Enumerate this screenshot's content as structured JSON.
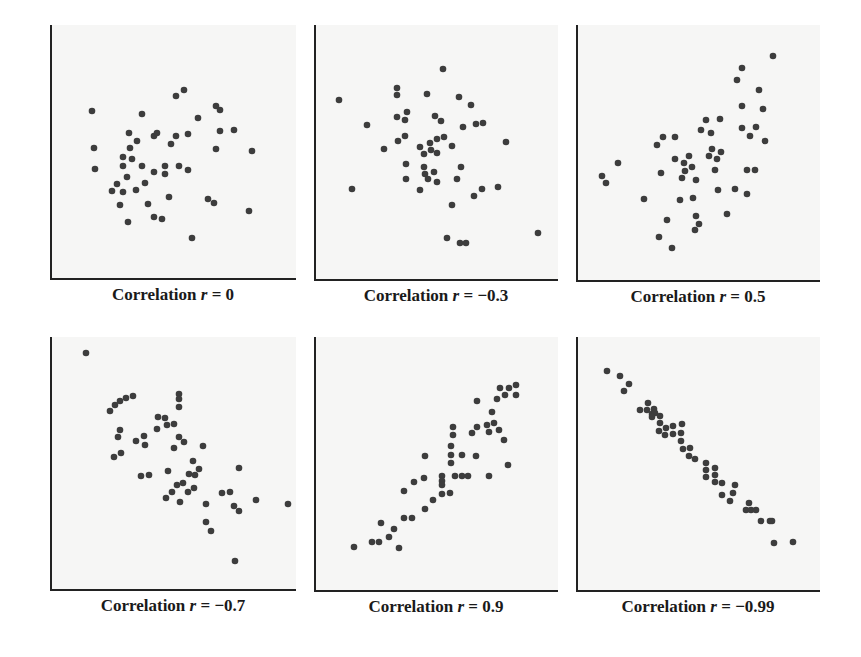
{
  "style": {
    "dot_color": "#3d3d3d",
    "axis_color": "#222222",
    "plot_bg": "#f6f6f5",
    "dot_radius": 3.3
  },
  "chart_data": [
    {
      "type": "scatter",
      "title": "Correlation r = 0",
      "r": "0",
      "caption": {
        "prefix": "Correlation ",
        "var": "r",
        "suffix": " = 0"
      },
      "box": {
        "x": 50,
        "y": 25,
        "w": 246,
        "h": 254
      },
      "points": [
        [
          42,
          86
        ],
        [
          44,
          123
        ],
        [
          45,
          144
        ],
        [
          92,
          89
        ],
        [
          126,
          71
        ],
        [
          134,
          65
        ],
        [
          166,
          81
        ],
        [
          170,
          85
        ],
        [
          148,
          93
        ],
        [
          79,
          108
        ],
        [
          87,
          116
        ],
        [
          104,
          111
        ],
        [
          107,
          108
        ],
        [
          126,
          111
        ],
        [
          138,
          109
        ],
        [
          170,
          106
        ],
        [
          184,
          105
        ],
        [
          80,
          123
        ],
        [
          121,
          119
        ],
        [
          166,
          124
        ],
        [
          202,
          126
        ],
        [
          73,
          132
        ],
        [
          82,
          134
        ],
        [
          73,
          141
        ],
        [
          92,
          141
        ],
        [
          115,
          141
        ],
        [
          129,
          141
        ],
        [
          138,
          145
        ],
        [
          104,
          147
        ],
        [
          115,
          149
        ],
        [
          77,
          152
        ],
        [
          67,
          159
        ],
        [
          95,
          158
        ],
        [
          62,
          166
        ],
        [
          73,
          167
        ],
        [
          86,
          165
        ],
        [
          119,
          172
        ],
        [
          158,
          174
        ],
        [
          164,
          178
        ],
        [
          70,
          180
        ],
        [
          98,
          179
        ],
        [
          104,
          192
        ],
        [
          112,
          194
        ],
        [
          78,
          197
        ],
        [
          199,
          186
        ],
        [
          142,
          213
        ]
      ]
    },
    {
      "type": "scatter",
      "title": "Correlation r = −0.3",
      "r": "-0.3",
      "caption": {
        "prefix": "Correlation ",
        "var": "r",
        "suffix": " = −0.3"
      },
      "box": {
        "x": 314,
        "y": 25,
        "w": 244,
        "h": 255
      },
      "points": [
        [
          25,
          75
        ],
        [
          38,
          164
        ],
        [
          53,
          100
        ],
        [
          70,
          124
        ],
        [
          83,
          63
        ],
        [
          83,
          70
        ],
        [
          83,
          92
        ],
        [
          91,
          95
        ],
        [
          93,
          87
        ],
        [
          84,
          116
        ],
        [
          91,
          111
        ],
        [
          92,
          139
        ],
        [
          92,
          154
        ],
        [
          106,
          165
        ],
        [
          113,
          69
        ],
        [
          129,
          44
        ],
        [
          121,
          91
        ],
        [
          127,
          96
        ],
        [
          106,
          122
        ],
        [
          110,
          129
        ],
        [
          116,
          118
        ],
        [
          117,
          125
        ],
        [
          123,
          114
        ],
        [
          130,
          112
        ],
        [
          123,
          128
        ],
        [
          110,
          142
        ],
        [
          111,
          149
        ],
        [
          114,
          154
        ],
        [
          120,
          147
        ],
        [
          123,
          157
        ],
        [
          138,
          121
        ],
        [
          145,
          72
        ],
        [
          149,
          102
        ],
        [
          157,
          80
        ],
        [
          162,
          99
        ],
        [
          169,
          98
        ],
        [
          147,
          142
        ],
        [
          143,
          154
        ],
        [
          138,
          180
        ],
        [
          160,
          171
        ],
        [
          168,
          164
        ],
        [
          184,
          162
        ],
        [
          192,
          117
        ],
        [
          133,
          213
        ],
        [
          146,
          218
        ],
        [
          152,
          218
        ],
        [
          224,
          208
        ]
      ]
    },
    {
      "type": "scatter",
      "title": "Correlation r = 0.5",
      "r": "0.5",
      "caption": {
        "prefix": "Correlation ",
        "var": "r",
        "suffix": " = 0.5"
      },
      "box": {
        "x": 576,
        "y": 25,
        "w": 244,
        "h": 256
      },
      "points": [
        [
          26,
          151
        ],
        [
          30,
          158
        ],
        [
          42,
          138
        ],
        [
          68,
          174
        ],
        [
          81,
          120
        ],
        [
          87,
          112
        ],
        [
          85,
          148
        ],
        [
          91,
          195
        ],
        [
          83,
          212
        ],
        [
          96,
          223
        ],
        [
          99,
          112
        ],
        [
          99,
          134
        ],
        [
          104,
          175
        ],
        [
          106,
          153
        ],
        [
          108,
          138
        ],
        [
          109,
          146
        ],
        [
          113,
          131
        ],
        [
          116,
          142
        ],
        [
          117,
          173
        ],
        [
          120,
          155
        ],
        [
          120,
          191
        ],
        [
          123,
          199
        ],
        [
          119,
          205
        ],
        [
          125,
          105
        ],
        [
          130,
          95
        ],
        [
          135,
          108
        ],
        [
          136,
          124
        ],
        [
          133,
          131
        ],
        [
          141,
          134
        ],
        [
          145,
          127
        ],
        [
          139,
          145
        ],
        [
          142,
          165
        ],
        [
          144,
          94
        ],
        [
          151,
          189
        ],
        [
          159,
          164
        ],
        [
          161,
          55
        ],
        [
          166,
          43
        ],
        [
          166,
          81
        ],
        [
          166,
          103
        ],
        [
          171,
          145
        ],
        [
          171,
          169
        ],
        [
          174,
          111
        ],
        [
          179,
          145
        ],
        [
          180,
          102
        ],
        [
          183,
          65
        ],
        [
          187,
          84
        ],
        [
          189,
          116
        ],
        [
          197,
          31
        ]
      ]
    },
    {
      "type": "scatter",
      "title": "Correlation r = −0.7",
      "r": "-0.7",
      "caption": {
        "prefix": "Correlation ",
        "var": "r",
        "suffix": " = −0.7"
      },
      "box": {
        "x": 50,
        "y": 337,
        "w": 246,
        "h": 253
      },
      "points": [
        [
          36,
          16
        ],
        [
          60,
          74
        ],
        [
          65,
          68
        ],
        [
          70,
          64
        ],
        [
          76,
          61
        ],
        [
          83,
          59
        ],
        [
          70,
          93
        ],
        [
          68,
          100
        ],
        [
          71,
          116
        ],
        [
          64,
          120
        ],
        [
          86,
          104
        ],
        [
          94,
          99
        ],
        [
          95,
          108
        ],
        [
          91,
          139
        ],
        [
          99,
          138
        ],
        [
          108,
          80
        ],
        [
          115,
          81
        ],
        [
          107,
          92
        ],
        [
          117,
          88
        ],
        [
          124,
          87
        ],
        [
          129,
          57
        ],
        [
          129,
          62
        ],
        [
          129,
          70
        ],
        [
          129,
          100
        ],
        [
          134,
          105
        ],
        [
          124,
          111
        ],
        [
          153,
          109
        ],
        [
          118,
          134
        ],
        [
          143,
          124
        ],
        [
          139,
          137
        ],
        [
          145,
          138
        ],
        [
          149,
          132
        ],
        [
          127,
          148
        ],
        [
          133,
          146
        ],
        [
          122,
          155
        ],
        [
          116,
          161
        ],
        [
          130,
          165
        ],
        [
          138,
          155
        ],
        [
          144,
          151
        ],
        [
          156,
          167
        ],
        [
          156,
          185
        ],
        [
          161,
          194
        ],
        [
          172,
          156
        ],
        [
          180,
          155
        ],
        [
          189,
          131
        ],
        [
          184,
          169
        ],
        [
          189,
          174
        ],
        [
          206,
          163
        ],
        [
          238,
          167
        ],
        [
          185,
          224
        ]
      ]
    },
    {
      "type": "scatter",
      "title": "Correlation r = 0.9",
      "r": "0.9",
      "caption": {
        "prefix": "Correlation ",
        "var": "r",
        "suffix": " = 0.9"
      },
      "box": {
        "x": 314,
        "y": 337,
        "w": 244,
        "h": 254
      },
      "points": [
        [
          40,
          210
        ],
        [
          58,
          205
        ],
        [
          65,
          205
        ],
        [
          67,
          186
        ],
        [
          75,
          200
        ],
        [
          80,
          192
        ],
        [
          85,
          211
        ],
        [
          90,
          181
        ],
        [
          98,
          181
        ],
        [
          90,
          154
        ],
        [
          100,
          145
        ],
        [
          110,
          141
        ],
        [
          111,
          119
        ],
        [
          111,
          172
        ],
        [
          119,
          163
        ],
        [
          128,
          157
        ],
        [
          136,
          156
        ],
        [
          128,
          139
        ],
        [
          128,
          144
        ],
        [
          128,
          148
        ],
        [
          141,
          139
        ],
        [
          148,
          139
        ],
        [
          154,
          139
        ],
        [
          137,
          126
        ],
        [
          137,
          118
        ],
        [
          137,
          109
        ],
        [
          139,
          98
        ],
        [
          139,
          90
        ],
        [
          148,
          118
        ],
        [
          162,
          119
        ],
        [
          158,
          96
        ],
        [
          163,
          90
        ],
        [
          163,
          64
        ],
        [
          173,
          88
        ],
        [
          175,
          95
        ],
        [
          180,
          86
        ],
        [
          178,
          75
        ],
        [
          185,
          93
        ],
        [
          190,
          103
        ],
        [
          194,
          128
        ],
        [
          175,
          139
        ],
        [
          183,
          62
        ],
        [
          186,
          51
        ],
        [
          191,
          58
        ],
        [
          195,
          51
        ],
        [
          202,
          48
        ],
        [
          202,
          58
        ]
      ]
    },
    {
      "type": "scatter",
      "title": "Correlation r = −0.99",
      "r": "-0.99",
      "caption": {
        "prefix": "Correlation ",
        "var": "r",
        "suffix": " = −0.99"
      },
      "box": {
        "x": 576,
        "y": 337,
        "w": 244,
        "h": 254
      },
      "points": [
        [
          31,
          34
        ],
        [
          44,
          39
        ],
        [
          53,
          47
        ],
        [
          48,
          54
        ],
        [
          64,
          73
        ],
        [
          72,
          66
        ],
        [
          71,
          73
        ],
        [
          78,
          72
        ],
        [
          76,
          77
        ],
        [
          79,
          76
        ],
        [
          76,
          80
        ],
        [
          84,
          79
        ],
        [
          84,
          86
        ],
        [
          83,
          94
        ],
        [
          90,
          91
        ],
        [
          89,
          98
        ],
        [
          97,
          89
        ],
        [
          97,
          97
        ],
        [
          106,
          87
        ],
        [
          105,
          96
        ],
        [
          105,
          104
        ],
        [
          107,
          112
        ],
        [
          114,
          111
        ],
        [
          113,
          119
        ],
        [
          119,
          122
        ],
        [
          130,
          126
        ],
        [
          130,
          133
        ],
        [
          130,
          140
        ],
        [
          139,
          131
        ],
        [
          139,
          138
        ],
        [
          139,
          145
        ],
        [
          146,
          146
        ],
        [
          146,
          158
        ],
        [
          154,
          164
        ],
        [
          157,
          156
        ],
        [
          159,
          148
        ],
        [
          173,
          166
        ],
        [
          170,
          173
        ],
        [
          175,
          173
        ],
        [
          180,
          173
        ],
        [
          185,
          184
        ],
        [
          194,
          184
        ],
        [
          196,
          184
        ],
        [
          198,
          206
        ],
        [
          217,
          205
        ]
      ]
    }
  ]
}
